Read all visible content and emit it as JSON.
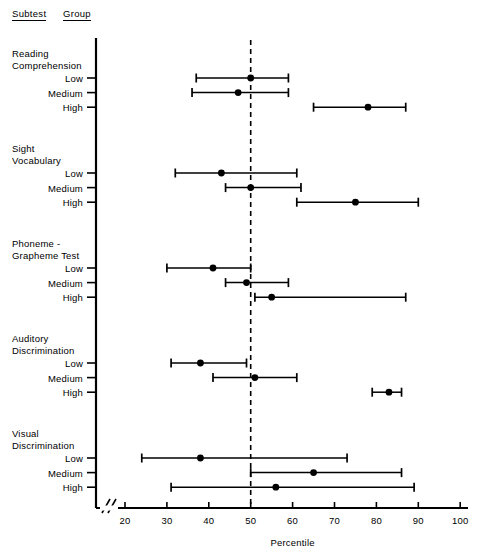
{
  "headers": {
    "subtest": "Subtest",
    "group": "Group"
  },
  "axis_title": "Percentile",
  "chart_data": {
    "type": "scatter",
    "title": "",
    "xlabel": "Percentile",
    "ylabel": "Subtest / Group",
    "xlim": [
      20,
      100
    ],
    "xticks": [
      20,
      30,
      40,
      50,
      60,
      70,
      80,
      90,
      100
    ],
    "axis_break": true,
    "grid": false,
    "reference_line": {
      "x": 50,
      "style": "dashed"
    },
    "error_bar_note": "horizontal range bars with end caps; filled circle marks the point estimate",
    "groups": [
      "Low",
      "Medium",
      "High"
    ],
    "subtests": [
      {
        "name": "Reading\nComprehension",
        "rows": [
          {
            "group": "Low",
            "value": 50,
            "low": 37,
            "high": 59
          },
          {
            "group": "Medium",
            "value": 47,
            "low": 36,
            "high": 59
          },
          {
            "group": "High",
            "value": 78,
            "low": 65,
            "high": 87
          }
        ]
      },
      {
        "name": "Sight\nVocabulary",
        "rows": [
          {
            "group": "Low",
            "value": 43,
            "low": 32,
            "high": 61
          },
          {
            "group": "Medium",
            "value": 50,
            "low": 44,
            "high": 62
          },
          {
            "group": "High",
            "value": 75,
            "low": 61,
            "high": 90
          }
        ]
      },
      {
        "name": "Phoneme -\nGrapheme Test",
        "rows": [
          {
            "group": "Low",
            "value": 41,
            "low": 30,
            "high": 50
          },
          {
            "group": "Medium",
            "value": 49,
            "low": 44,
            "high": 59
          },
          {
            "group": "High",
            "value": 55,
            "low": 51,
            "high": 87
          }
        ]
      },
      {
        "name": "Auditory\nDiscrimination",
        "rows": [
          {
            "group": "Low",
            "value": 38,
            "low": 31,
            "high": 49
          },
          {
            "group": "Medium",
            "value": 51,
            "low": 41,
            "high": 61
          },
          {
            "group": "High",
            "value": 83,
            "low": 79,
            "high": 86
          }
        ]
      },
      {
        "name": "Visual\nDiscrimination",
        "rows": [
          {
            "group": "Low",
            "value": 38,
            "low": 24,
            "high": 73
          },
          {
            "group": "Medium",
            "value": 65,
            "low": 50,
            "high": 86
          },
          {
            "group": "High",
            "value": 56,
            "low": 31,
            "high": 89
          }
        ]
      }
    ]
  },
  "colors": {
    "ink": "#000000",
    "background": "#ffffff"
  }
}
